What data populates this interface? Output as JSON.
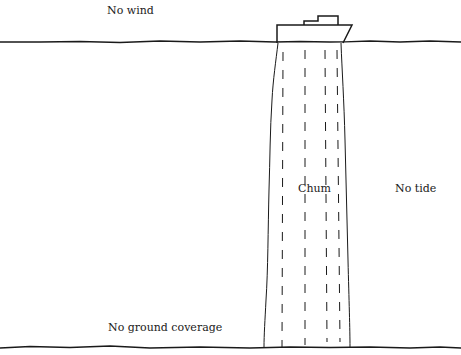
{
  "diagram": {
    "labels": {
      "wind": "No wind",
      "chum": "Chum",
      "tide": "No tide",
      "ground": "No ground coverage"
    },
    "elements": {
      "boat": "boat-icon",
      "surface": "water-surface-line",
      "seabed": "seabed-line",
      "chum_column": "chum-slick-column"
    },
    "colors": {
      "ink": "#1a1a1a",
      "background": "#ffffff"
    }
  }
}
